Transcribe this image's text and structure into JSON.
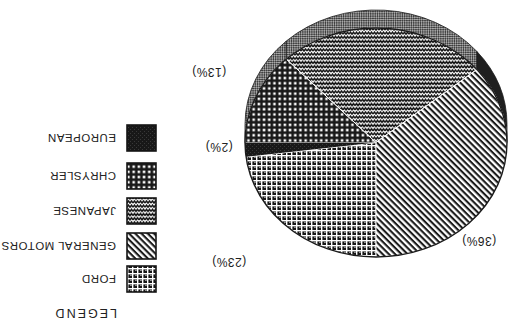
{
  "figure": {
    "kind": "scanned pie chart figure",
    "printed_rotation_deg": 180,
    "background": "#ffffff",
    "ink": "#1d1d1d"
  },
  "chart_data": {
    "type": "pie",
    "style": "3d-ellipse",
    "title": "",
    "start_angle_deg": 90,
    "direction": "clockwise",
    "depth_px": 18,
    "slices": [
      {
        "id": "ford",
        "label": "FORD",
        "value": 23,
        "display": "(23%)",
        "pattern": "waffle-grid",
        "rim": "checker"
      },
      {
        "id": "european",
        "label": "EUROPEAN",
        "value": 2,
        "display": "(2%)",
        "pattern": "solid-dark",
        "rim": "checker"
      },
      {
        "id": "chrysler",
        "label": "CHRYSLER",
        "value": 13,
        "display": "(13%)",
        "pattern": "square-dots",
        "rim": "checker"
      },
      {
        "id": "japanese",
        "label": "JAPANESE",
        "value": 26,
        "display": "",
        "pattern": "zigzag",
        "rim": "checker"
      },
      {
        "id": "gm",
        "label": "GENERAL MOTORS",
        "value": 36,
        "display": "(36%)",
        "pattern": "diagonal-weave",
        "rim": "dark"
      }
    ],
    "categories": [
      "FORD",
      "EUROPEAN",
      "CHRYSLER",
      "JAPANESE",
      "GENERAL MOTORS"
    ],
    "values": [
      23,
      2,
      13,
      26,
      36
    ],
    "colors": {
      "ink": "#1a1a1a",
      "paper": "#ffffff",
      "rim_checker_light": "#a8a8a8",
      "rim_checker_dark": "#3f3f3f",
      "rim_dark_segment": "#1f1f1f"
    }
  },
  "legend": {
    "title": "LEGEND",
    "items": [
      {
        "label": "FORD",
        "pattern": "waffle-grid"
      },
      {
        "label": "GENERAL MOTORS",
        "pattern": "diagonal-weave"
      },
      {
        "label": "JAPANESE",
        "pattern": "zigzag"
      },
      {
        "label": "CHRYSLER",
        "pattern": "square-dots"
      },
      {
        "label": "EUROPEAN",
        "pattern": "solid-dark"
      }
    ]
  }
}
